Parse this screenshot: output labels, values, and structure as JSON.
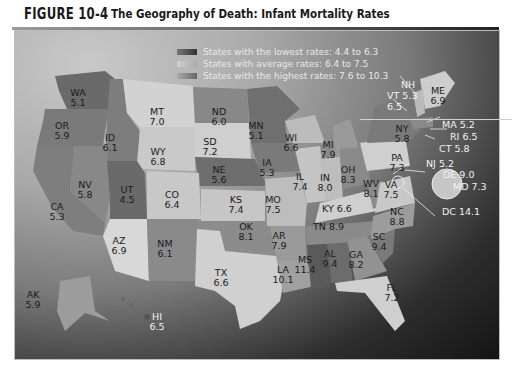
{
  "figure": {
    "number": "FIGURE 10-4",
    "title": "The Geography of Death: Infant Mortality Rates"
  },
  "legend": {
    "items": [
      {
        "label": "States with the lowest rates: 4.4 to 6.3",
        "color": "#555555"
      },
      {
        "label": "States with average rates: 6.4 to 7.5",
        "color": "#b8b8b8"
      },
      {
        "label": "States with the highest rates: 7.6 to 10.3",
        "color": "#7a7a7a"
      }
    ]
  },
  "states": {
    "WA": {
      "abbr": "WA",
      "rate": "5.1"
    },
    "OR": {
      "abbr": "OR",
      "rate": "5.9"
    },
    "ID": {
      "abbr": "ID",
      "rate": "6.1"
    },
    "MT": {
      "abbr": "MT",
      "rate": "7.0"
    },
    "WY": {
      "abbr": "WY",
      "rate": "6.8"
    },
    "ND": {
      "abbr": "ND",
      "rate": "6.0"
    },
    "SD": {
      "abbr": "SD",
      "rate": "7.2"
    },
    "NE": {
      "abbr": "NE",
      "rate": "5.6"
    },
    "MN": {
      "abbr": "MN",
      "rate": "5.1"
    },
    "IA": {
      "abbr": "IA",
      "rate": "5.3"
    },
    "WI": {
      "abbr": "WI",
      "rate": "6.6"
    },
    "MI": {
      "abbr": "MI",
      "rate": "7.9"
    },
    "IL": {
      "abbr": "IL",
      "rate": "7.4"
    },
    "IN": {
      "abbr": "IN",
      "rate": "8.0"
    },
    "OH": {
      "abbr": "OH",
      "rate": "8.3"
    },
    "NV": {
      "abbr": "NV",
      "rate": "5.8"
    },
    "UT": {
      "abbr": "UT",
      "rate": "4.5"
    },
    "CO": {
      "abbr": "CO",
      "rate": "6.4"
    },
    "KS": {
      "abbr": "KS",
      "rate": "7.4"
    },
    "MO": {
      "abbr": "MO",
      "rate": "7.5"
    },
    "KY": {
      "abbr": "KY",
      "rate": "6.6"
    },
    "WV": {
      "abbr": "WV",
      "rate": "8.1"
    },
    "VA": {
      "abbr": "VA",
      "rate": "7.5"
    },
    "PA": {
      "abbr": "PA",
      "rate": "7.3"
    },
    "NY": {
      "abbr": "NY",
      "rate": "5.8"
    },
    "CA": {
      "abbr": "CA",
      "rate": "5.3"
    },
    "AZ": {
      "abbr": "AZ",
      "rate": "6.9"
    },
    "NM": {
      "abbr": "NM",
      "rate": "6.1"
    },
    "OK": {
      "abbr": "OK",
      "rate": "8.1"
    },
    "TX": {
      "abbr": "TX",
      "rate": "6.6"
    },
    "AR": {
      "abbr": "AR",
      "rate": "7.9"
    },
    "TN": {
      "abbr": "TN",
      "rate": "8.9"
    },
    "LA": {
      "abbr": "LA",
      "rate": "10.1"
    },
    "MS": {
      "abbr": "MS",
      "rate": "11.4"
    },
    "AL": {
      "abbr": "AL",
      "rate": "9.4"
    },
    "GA": {
      "abbr": "GA",
      "rate": "8.2"
    },
    "SC": {
      "abbr": "SC",
      "rate": "9.4"
    },
    "NC": {
      "abbr": "NC",
      "rate": "8.8"
    },
    "FL": {
      "abbr": "FL",
      "rate": "7.2"
    },
    "AK": {
      "abbr": "AK",
      "rate": "5.9"
    },
    "HI": {
      "abbr": "HI",
      "rate": "6.5"
    },
    "NH": {
      "abbr": "NH",
      "rate": "6.5"
    },
    "VT": {
      "abbr": "VT",
      "rate": "5.3"
    },
    "ME": {
      "abbr": "ME",
      "rate": "6.9"
    }
  },
  "callouts": {
    "MA": "MA 5.2",
    "RI": "RI 6.5",
    "CT": "CT 5.8",
    "NJ": "NJ 5.2",
    "DE": "DE 9.0",
    "MD": "MD 7.3",
    "DC": "DC 14.1",
    "VT": "VT 5.3",
    "NH": "NH"
  }
}
